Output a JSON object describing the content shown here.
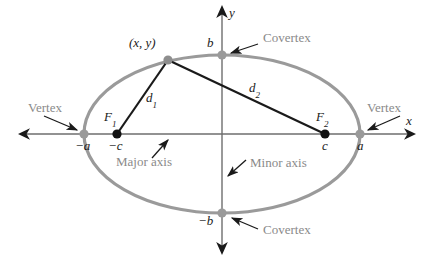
{
  "figure": {
    "colors": {
      "ellipse_curve": "#9a9a9a",
      "axis_line": "#6e6e6e",
      "chord_line": "#1a1a1a",
      "vertex_dot": "#9a9a9a",
      "focus_dot": "#111111",
      "callout_text": "#8a8a8a",
      "math_text": "#1a1a1a",
      "background": "#ffffff"
    }
  },
  "axes": {
    "x_label": "x",
    "y_label": "y"
  },
  "callouts": {
    "vertex_left": "Vertex",
    "vertex_right": "Vertex",
    "covertex_top": "Covertex",
    "covertex_bottom": "Covertex",
    "major_axis": "Major axis",
    "minor_axis": "Minor axis"
  },
  "points": {
    "point_on_ellipse": "(x, y)",
    "focus_left_name": "F",
    "focus_left_sub": "1",
    "focus_right_name": "F",
    "focus_right_sub": "2",
    "vertex_left_value": "−a",
    "vertex_right_value": "a",
    "focus_left_value": "−c",
    "focus_right_value": "c",
    "covertex_top_value": "b",
    "covertex_bottom_value": "−b"
  },
  "distances": {
    "d1_name": "d",
    "d1_sub": "1",
    "d2_name": "d",
    "d2_sub": "2"
  },
  "geometry": {
    "center_x": 222,
    "center_y": 134,
    "semi_major_a": 138,
    "semi_minor_b": 79,
    "focus_c": 105,
    "point_x": 168,
    "point_y": 60
  }
}
